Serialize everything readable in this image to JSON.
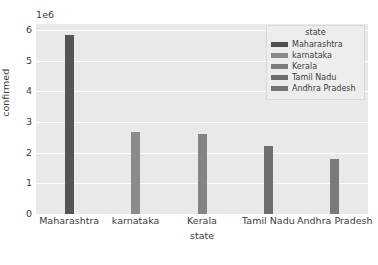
{
  "chart_data": {
    "type": "bar",
    "title": "",
    "xlabel": "state",
    "ylabel": "confirmed",
    "categories": [
      "Maharashtra",
      "karnataka",
      "Kerala",
      "Tamil Nadu",
      "Andhra Pradesh"
    ],
    "values": [
      5850000,
      2680000,
      2620000,
      2230000,
      1780000
    ],
    "ylim": [
      0,
      6200000
    ],
    "yticks": [
      "0",
      "1",
      "2",
      "3",
      "4",
      "5",
      "6"
    ],
    "ytick_values": [
      0,
      1000000,
      2000000,
      3000000,
      4000000,
      5000000,
      6000000
    ],
    "offset_text": "1e6",
    "grid": true,
    "legend": {
      "title": "state",
      "position": "upper right",
      "entries": [
        {
          "label": "Maharashtra",
          "color": "#4f4f4f"
        },
        {
          "label": "karnataka",
          "color": "#8a8a8a"
        },
        {
          "label": "Kerala",
          "color": "#7d7d7d"
        },
        {
          "label": "Tamil Nadu",
          "color": "#6b6b6b"
        },
        {
          "label": "Andhra Pradesh",
          "color": "#757575"
        }
      ]
    },
    "bar_colors": [
      "#555555",
      "#8b8b8b",
      "#848484",
      "#6f6f6f",
      "#7a7a7a"
    ],
    "plot_background": "#e9e9e9",
    "gridline_color": "#fdfdfd",
    "figure_background": "#ffffff"
  }
}
